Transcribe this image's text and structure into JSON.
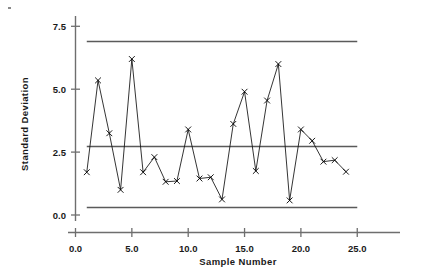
{
  "chart_data": {
    "type": "line",
    "title": "",
    "subtitle": "",
    "xlabel": "Sample  Number",
    "ylabel": "Standard  Deviation",
    "xlim": [
      0.0,
      26.5
    ],
    "ylim": [
      0.0,
      8.3
    ],
    "x_ticks": [
      "0.0",
      "5.0",
      "10.0",
      "15.0",
      "20.0",
      "25.0"
    ],
    "x_tick_values": [
      0.0,
      5.0,
      10.0,
      15.0,
      20.0,
      25.0
    ],
    "y_ticks": [
      "0.0",
      "2.5",
      "5.0",
      "7.5"
    ],
    "y_tick_values": [
      0.0,
      2.5,
      5.0,
      7.5
    ],
    "grid": false,
    "legend": "none",
    "marker": "x",
    "x": [
      1,
      2,
      3,
      4,
      5,
      6,
      7,
      8,
      9,
      10,
      11,
      12,
      13,
      14,
      15,
      16,
      17,
      18,
      19,
      20,
      21,
      22,
      23,
      24
    ],
    "series": [
      {
        "name": "Standard Deviation",
        "values": [
          1.7,
          5.35,
          3.25,
          1.0,
          6.2,
          1.7,
          2.3,
          1.32,
          1.35,
          3.4,
          1.45,
          1.5,
          0.62,
          3.62,
          4.9,
          1.75,
          4.55,
          6.0,
          0.58,
          3.4,
          2.95,
          2.12,
          2.18,
          1.72
        ]
      }
    ],
    "control_limits": {
      "ucl": 6.9,
      "center": 2.72,
      "lcl": 0.3,
      "span_x": [
        1.0,
        25.0
      ]
    }
  },
  "axes": {
    "y_label": "Standard  Deviation",
    "x_label": "Sample  Number"
  }
}
